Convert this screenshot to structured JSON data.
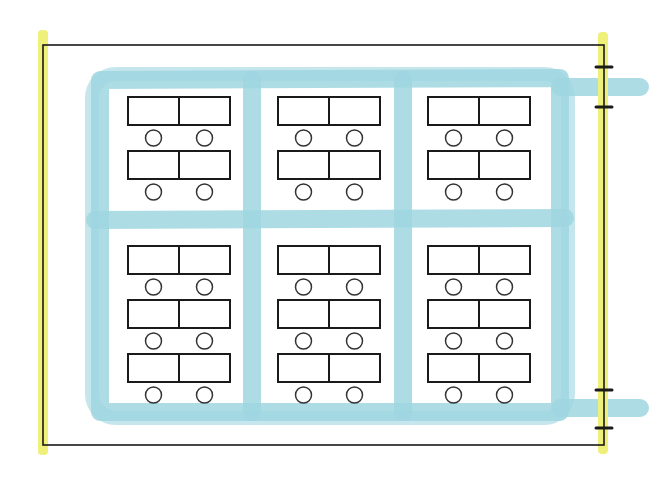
{
  "diagram": {
    "colors": {
      "background": "#ffffff",
      "wall_line": "#1a1a1a",
      "wall_highlight": "#eef07a",
      "aisle": "#9fd6e0",
      "desk_stroke": "#1a1a1a",
      "desk_fill": "#ffffff",
      "chair_stroke": "#333333"
    },
    "room": {
      "x": 43,
      "y": 45,
      "width": 561,
      "height": 400
    },
    "walls_highlighted": [
      "left",
      "right"
    ],
    "doors": [
      {
        "wall": "right",
        "y_start": 67,
        "y_end": 107
      },
      {
        "wall": "right",
        "y_start": 390,
        "y_end": 428
      }
    ],
    "desk_groups": [
      {
        "id": "group-top-left",
        "x": 128,
        "rows_y": [
          97,
          151
        ]
      },
      {
        "id": "group-top-middle",
        "x": 278,
        "rows_y": [
          97,
          151
        ]
      },
      {
        "id": "group-top-right",
        "x": 428,
        "rows_y": [
          97,
          151
        ]
      },
      {
        "id": "group-bottom-left",
        "x": 128,
        "rows_y": [
          246,
          300,
          354
        ]
      },
      {
        "id": "group-bottom-middle",
        "x": 278,
        "rows_y": [
          246,
          300,
          354
        ]
      },
      {
        "id": "group-bottom-right",
        "x": 428,
        "rows_y": [
          246,
          300,
          354
        ]
      }
    ],
    "desk": {
      "pair_width": 102,
      "height": 28,
      "seats_per_row": 2
    },
    "chair": {
      "radius": 8,
      "offset_below_desk": 13
    },
    "counts": {
      "desk_groups": 6,
      "desk_rows": 15,
      "seats": 30
    }
  }
}
